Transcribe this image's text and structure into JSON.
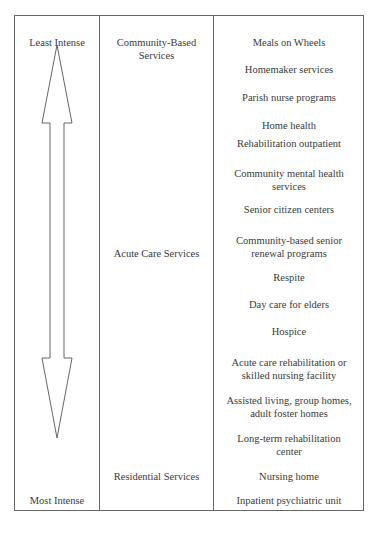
{
  "intensity_scale": {
    "top_label": "Least Intense",
    "bottom_label": "Most Intense",
    "arrow": "double-headed-vertical-arrow"
  },
  "categories": [
    {
      "label": "Community-Based Services"
    },
    {
      "label": "Acute Care Services"
    },
    {
      "label": "Residential Services"
    }
  ],
  "services": [
    {
      "label": "Meals on Wheels"
    },
    {
      "label": "Homemaker services"
    },
    {
      "label": "Parish nurse programs"
    },
    {
      "label": "Home health"
    },
    {
      "label": "Rehabilitation outpatient"
    },
    {
      "label": "Community mental health services"
    },
    {
      "label": "Senior citizen centers"
    },
    {
      "label": "Community-based senior renewal programs"
    },
    {
      "label": "Respite"
    },
    {
      "label": "Day care for elders"
    },
    {
      "label": "Hospice"
    },
    {
      "label": "Acute care rehabilitation or skilled nursing facility"
    },
    {
      "label": "Assisted living, group homes, adult foster homes"
    },
    {
      "label": "Long-term rehabilitation center"
    },
    {
      "label": "Nursing home"
    },
    {
      "label": "Inpatient psychiatric unit"
    }
  ],
  "colors": {
    "border": "#666666",
    "text": "#3a3a3a",
    "background": "#ffffff"
  }
}
